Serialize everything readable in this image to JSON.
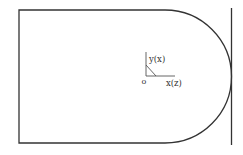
{
  "diagram": {
    "colors": {
      "background": "#ffffff",
      "stroke": "#333333",
      "text": "#333333"
    },
    "shape": {
      "left": 19,
      "top": 10,
      "bottom": 143,
      "arc_start_x": 165,
      "radius": 66.5
    },
    "wall": {
      "x": 231,
      "y1": 8,
      "y2": 145
    },
    "axes": {
      "origin_label": "o",
      "vertical_label": "y(x)",
      "horizontal_label": "x(z)"
    }
  }
}
